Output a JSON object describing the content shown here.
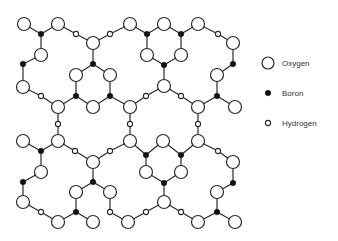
{
  "legend": {
    "items": [
      {
        "label": "Oxygen",
        "symbol": "large-open-circle",
        "x": 268,
        "y": 63
      },
      {
        "label": "Boron",
        "symbol": "small-filled-circle",
        "x": 268,
        "y": 93
      },
      {
        "label": "Hydrogen",
        "symbol": "tiny-open-circle",
        "x": 268,
        "y": 123
      }
    ]
  },
  "colors": {
    "line": "#2a2a2a",
    "boron_fill": "#111111",
    "background": "#ffffff"
  },
  "node_radii": {
    "O": 6.5,
    "B": 2.8,
    "H": 2.6
  },
  "nodes": [
    {
      "id": "o1",
      "type": "O",
      "x": 24,
      "y": 24
    },
    {
      "id": "o2",
      "type": "O",
      "x": 58,
      "y": 24
    },
    {
      "id": "b1",
      "type": "B",
      "x": 41,
      "y": 34
    },
    {
      "id": "o3",
      "type": "O",
      "x": 41,
      "y": 55
    },
    {
      "id": "b2",
      "type": "B",
      "x": 23,
      "y": 64
    },
    {
      "id": "o4",
      "type": "O",
      "x": 23,
      "y": 87
    },
    {
      "id": "h1",
      "type": "H",
      "x": 41,
      "y": 96
    },
    {
      "id": "o5",
      "type": "O",
      "x": 58,
      "y": 107
    },
    {
      "id": "h2",
      "type": "H",
      "x": 76,
      "y": 34
    },
    {
      "id": "o6",
      "type": "O",
      "x": 93,
      "y": 43
    },
    {
      "id": "b3",
      "type": "B",
      "x": 93,
      "y": 64
    },
    {
      "id": "o7",
      "type": "O",
      "x": 76,
      "y": 75
    },
    {
      "id": "o8",
      "type": "O",
      "x": 110,
      "y": 75
    },
    {
      "id": "b4",
      "type": "B",
      "x": 76,
      "y": 96
    },
    {
      "id": "b5",
      "type": "B",
      "x": 110,
      "y": 96
    },
    {
      "id": "o9",
      "type": "O",
      "x": 93,
      "y": 107
    },
    {
      "id": "h3",
      "type": "H",
      "x": 110,
      "y": 34
    },
    {
      "id": "o10",
      "type": "O",
      "x": 130,
      "y": 24
    },
    {
      "id": "o11",
      "type": "O",
      "x": 164,
      "y": 24
    },
    {
      "id": "o12",
      "type": "O",
      "x": 198,
      "y": 24
    },
    {
      "id": "b6",
      "type": "B",
      "x": 147,
      "y": 34
    },
    {
      "id": "b7",
      "type": "B",
      "x": 181,
      "y": 34
    },
    {
      "id": "o13",
      "type": "O",
      "x": 147,
      "y": 55
    },
    {
      "id": "o14",
      "type": "O",
      "x": 181,
      "y": 55
    },
    {
      "id": "b8",
      "type": "B",
      "x": 164,
      "y": 65
    },
    {
      "id": "o15",
      "type": "O",
      "x": 164,
      "y": 86
    },
    {
      "id": "h4",
      "type": "H",
      "x": 146,
      "y": 96
    },
    {
      "id": "h5",
      "type": "H",
      "x": 181,
      "y": 96
    },
    {
      "id": "o16",
      "type": "O",
      "x": 130,
      "y": 107
    },
    {
      "id": "o17",
      "type": "O",
      "x": 198,
      "y": 107
    },
    {
      "id": "h6",
      "type": "H",
      "x": 218,
      "y": 34
    },
    {
      "id": "o18",
      "type": "O",
      "x": 233,
      "y": 43
    },
    {
      "id": "b9",
      "type": "B",
      "x": 233,
      "y": 64
    },
    {
      "id": "o19",
      "type": "O",
      "x": 217,
      "y": 75
    },
    {
      "id": "b10",
      "type": "B",
      "x": 217,
      "y": 96
    },
    {
      "id": "o20",
      "type": "O",
      "x": 235,
      "y": 107
    },
    {
      "id": "h7",
      "type": "H",
      "x": 58,
      "y": 124
    },
    {
      "id": "h8",
      "type": "H",
      "x": 130,
      "y": 124
    },
    {
      "id": "h9",
      "type": "H",
      "x": 198,
      "y": 124
    },
    {
      "id": "o21",
      "type": "O",
      "x": 23,
      "y": 141
    },
    {
      "id": "b11",
      "type": "B",
      "x": 41,
      "y": 151
    },
    {
      "id": "o22",
      "type": "O",
      "x": 58,
      "y": 141
    },
    {
      "id": "h10",
      "type": "H",
      "x": 75,
      "y": 151
    },
    {
      "id": "o23",
      "type": "O",
      "x": 93,
      "y": 162
    },
    {
      "id": "h11",
      "type": "H",
      "x": 110,
      "y": 151
    },
    {
      "id": "o24",
      "type": "O",
      "x": 130,
      "y": 141
    },
    {
      "id": "b12",
      "type": "B",
      "x": 146,
      "y": 155
    },
    {
      "id": "o25",
      "type": "O",
      "x": 163,
      "y": 141
    },
    {
      "id": "b13",
      "type": "B",
      "x": 181,
      "y": 155
    },
    {
      "id": "o26",
      "type": "O",
      "x": 198,
      "y": 141
    },
    {
      "id": "h12",
      "type": "H",
      "x": 218,
      "y": 151
    },
    {
      "id": "o27",
      "type": "O",
      "x": 233,
      "y": 162
    },
    {
      "id": "o28",
      "type": "O",
      "x": 41,
      "y": 172
    },
    {
      "id": "b14",
      "type": "B",
      "x": 23,
      "y": 182
    },
    {
      "id": "o29",
      "type": "O",
      "x": 23,
      "y": 202
    },
    {
      "id": "h13",
      "type": "H",
      "x": 41,
      "y": 212
    },
    {
      "id": "o30",
      "type": "O",
      "x": 58,
      "y": 222
    },
    {
      "id": "b15",
      "type": "B",
      "x": 93,
      "y": 182
    },
    {
      "id": "o31",
      "type": "O",
      "x": 76,
      "y": 192
    },
    {
      "id": "o32",
      "type": "O",
      "x": 110,
      "y": 192
    },
    {
      "id": "b16",
      "type": "B",
      "x": 76,
      "y": 212
    },
    {
      "id": "h14",
      "type": "H",
      "x": 110,
      "y": 212
    },
    {
      "id": "o33",
      "type": "O",
      "x": 93,
      "y": 222
    },
    {
      "id": "o34",
      "type": "O",
      "x": 128,
      "y": 222
    },
    {
      "id": "o35",
      "type": "O",
      "x": 146,
      "y": 172
    },
    {
      "id": "o36",
      "type": "O",
      "x": 181,
      "y": 172
    },
    {
      "id": "b17",
      "type": "B",
      "x": 164,
      "y": 183
    },
    {
      "id": "o37",
      "type": "O",
      "x": 164,
      "y": 202
    },
    {
      "id": "h15",
      "type": "H",
      "x": 146,
      "y": 212
    },
    {
      "id": "h16",
      "type": "H",
      "x": 181,
      "y": 212
    },
    {
      "id": "o38",
      "type": "O",
      "x": 198,
      "y": 222
    },
    {
      "id": "b18",
      "type": "B",
      "x": 233,
      "y": 183
    },
    {
      "id": "o39",
      "type": "O",
      "x": 217,
      "y": 192
    },
    {
      "id": "b19",
      "type": "B",
      "x": 217,
      "y": 212
    },
    {
      "id": "o40",
      "type": "O",
      "x": 235,
      "y": 222
    }
  ],
  "bonds": [
    [
      "o1",
      "b1"
    ],
    [
      "o2",
      "b1"
    ],
    [
      "b1",
      "o3"
    ],
    [
      "o3",
      "b2"
    ],
    [
      "b2",
      "o4"
    ],
    [
      "o4",
      "h1"
    ],
    [
      "h1",
      "o5"
    ],
    [
      "o2",
      "h2"
    ],
    [
      "h2",
      "o6"
    ],
    [
      "o6",
      "b3"
    ],
    [
      "b3",
      "o7"
    ],
    [
      "b3",
      "o8"
    ],
    [
      "o7",
      "b4"
    ],
    [
      "o8",
      "b5"
    ],
    [
      "b4",
      "o5"
    ],
    [
      "b4",
      "o9"
    ],
    [
      "b5",
      "o9"
    ],
    [
      "b5",
      "o16"
    ],
    [
      "o6",
      "h3"
    ],
    [
      "h3",
      "o10"
    ],
    [
      "o10",
      "b6"
    ],
    [
      "o11",
      "b6"
    ],
    [
      "o11",
      "b7"
    ],
    [
      "o12",
      "b7"
    ],
    [
      "b6",
      "o13"
    ],
    [
      "b7",
      "o14"
    ],
    [
      "o13",
      "b8"
    ],
    [
      "o14",
      "b8"
    ],
    [
      "b8",
      "o15"
    ],
    [
      "o15",
      "h4"
    ],
    [
      "o15",
      "h5"
    ],
    [
      "h4",
      "o16"
    ],
    [
      "h5",
      "o17"
    ],
    [
      "o12",
      "h6"
    ],
    [
      "h6",
      "o18"
    ],
    [
      "o18",
      "b9"
    ],
    [
      "b9",
      "o19"
    ],
    [
      "o19",
      "b10"
    ],
    [
      "b10",
      "o17"
    ],
    [
      "b10",
      "o20"
    ],
    [
      "o5",
      "h7"
    ],
    [
      "h7",
      "o22"
    ],
    [
      "o16",
      "h8"
    ],
    [
      "h8",
      "o24"
    ],
    [
      "o17",
      "h9"
    ],
    [
      "h9",
      "o26"
    ],
    [
      "o21",
      "b11"
    ],
    [
      "o22",
      "b11"
    ],
    [
      "b11",
      "o28"
    ],
    [
      "o22",
      "h10"
    ],
    [
      "h10",
      "o23"
    ],
    [
      "o23",
      "h11"
    ],
    [
      "h11",
      "o24"
    ],
    [
      "o24",
      "b12"
    ],
    [
      "o25",
      "b12"
    ],
    [
      "o25",
      "b13"
    ],
    [
      "o26",
      "b13"
    ],
    [
      "o26",
      "h12"
    ],
    [
      "h12",
      "o27"
    ],
    [
      "o28",
      "b14"
    ],
    [
      "b14",
      "o29"
    ],
    [
      "o29",
      "h13"
    ],
    [
      "h13",
      "o30"
    ],
    [
      "o30",
      "b16"
    ],
    [
      "o23",
      "b15"
    ],
    [
      "b15",
      "o31"
    ],
    [
      "b15",
      "o32"
    ],
    [
      "o31",
      "b16"
    ],
    [
      "b16",
      "o33"
    ],
    [
      "o32",
      "h14"
    ],
    [
      "h14",
      "o34"
    ],
    [
      "b12",
      "o35"
    ],
    [
      "b13",
      "o36"
    ],
    [
      "o35",
      "b17"
    ],
    [
      "o36",
      "b17"
    ],
    [
      "b17",
      "o37"
    ],
    [
      "o37",
      "h15"
    ],
    [
      "o37",
      "h16"
    ],
    [
      "h15",
      "o34"
    ],
    [
      "h16",
      "o38"
    ],
    [
      "o27",
      "b18"
    ],
    [
      "b18",
      "o39"
    ],
    [
      "o39",
      "b19"
    ],
    [
      "b19",
      "o38"
    ],
    [
      "b19",
      "o40"
    ]
  ]
}
